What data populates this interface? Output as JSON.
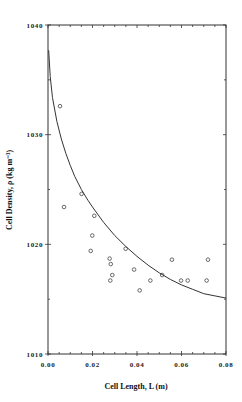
{
  "chart_data": {
    "type": "scatter",
    "title": "",
    "xlabel": "Cell Length, L (m)",
    "ylabel": "Cell Density, ρ (kg m⁻³)",
    "xlim": [
      0.0,
      0.08
    ],
    "ylim": [
      1010,
      1040
    ],
    "x_ticks": [
      0.0,
      0.02,
      0.04,
      0.06,
      0.08
    ],
    "x_tick_labels": [
      "0.00",
      "0.02",
      "0.04",
      "0.06",
      "0.08"
    ],
    "x_minor_step": 0.005,
    "y_ticks": [
      1010,
      1020,
      1030,
      1040
    ],
    "y_tick_labels": [
      "1010",
      "1020",
      "1030",
      "1040"
    ],
    "y_minor_step": 5,
    "grid": false,
    "legend": null,
    "series": [
      {
        "name": "Measured cells",
        "kind": "scatter",
        "marker": "open-circle",
        "points": [
          {
            "x": 0.0054,
            "y": 1032.6
          },
          {
            "x": 0.0072,
            "y": 1023.4
          },
          {
            "x": 0.0151,
            "y": 1024.6
          },
          {
            "x": 0.0208,
            "y": 1022.6
          },
          {
            "x": 0.0199,
            "y": 1020.8
          },
          {
            "x": 0.0192,
            "y": 1019.4
          },
          {
            "x": 0.0277,
            "y": 1018.7
          },
          {
            "x": 0.0282,
            "y": 1018.2
          },
          {
            "x": 0.0289,
            "y": 1017.2
          },
          {
            "x": 0.028,
            "y": 1016.7
          },
          {
            "x": 0.0349,
            "y": 1019.6
          },
          {
            "x": 0.0387,
            "y": 1017.7
          },
          {
            "x": 0.0412,
            "y": 1015.8
          },
          {
            "x": 0.046,
            "y": 1016.7
          },
          {
            "x": 0.0513,
            "y": 1017.2
          },
          {
            "x": 0.0557,
            "y": 1018.6
          },
          {
            "x": 0.0598,
            "y": 1016.7
          },
          {
            "x": 0.0628,
            "y": 1016.7
          },
          {
            "x": 0.0713,
            "y": 1016.7
          },
          {
            "x": 0.0719,
            "y": 1018.6
          }
        ]
      },
      {
        "name": "Fitted curve",
        "kind": "line",
        "points": [
          {
            "x": 0.0003,
            "y": 1037.7
          },
          {
            "x": 0.001,
            "y": 1035.3
          },
          {
            "x": 0.002,
            "y": 1033.4
          },
          {
            "x": 0.004,
            "y": 1031.2
          },
          {
            "x": 0.006,
            "y": 1029.6
          },
          {
            "x": 0.008,
            "y": 1028.3
          },
          {
            "x": 0.01,
            "y": 1027.2
          },
          {
            "x": 0.012,
            "y": 1026.2
          },
          {
            "x": 0.015,
            "y": 1025.0
          },
          {
            "x": 0.018,
            "y": 1024.0
          },
          {
            "x": 0.02,
            "y": 1023.4
          },
          {
            "x": 0.025,
            "y": 1022.0
          },
          {
            "x": 0.03,
            "y": 1020.8
          },
          {
            "x": 0.035,
            "y": 1019.8
          },
          {
            "x": 0.04,
            "y": 1018.9
          },
          {
            "x": 0.045,
            "y": 1018.1
          },
          {
            "x": 0.05,
            "y": 1017.4
          },
          {
            "x": 0.055,
            "y": 1016.8
          },
          {
            "x": 0.06,
            "y": 1016.3
          },
          {
            "x": 0.065,
            "y": 1015.9
          },
          {
            "x": 0.07,
            "y": 1015.5
          },
          {
            "x": 0.075,
            "y": 1015.3
          },
          {
            "x": 0.08,
            "y": 1015.1
          }
        ]
      }
    ]
  },
  "colors": {
    "axis": "#333333",
    "curve": "#333333",
    "marker": "#444444",
    "background": "#ffffff"
  }
}
